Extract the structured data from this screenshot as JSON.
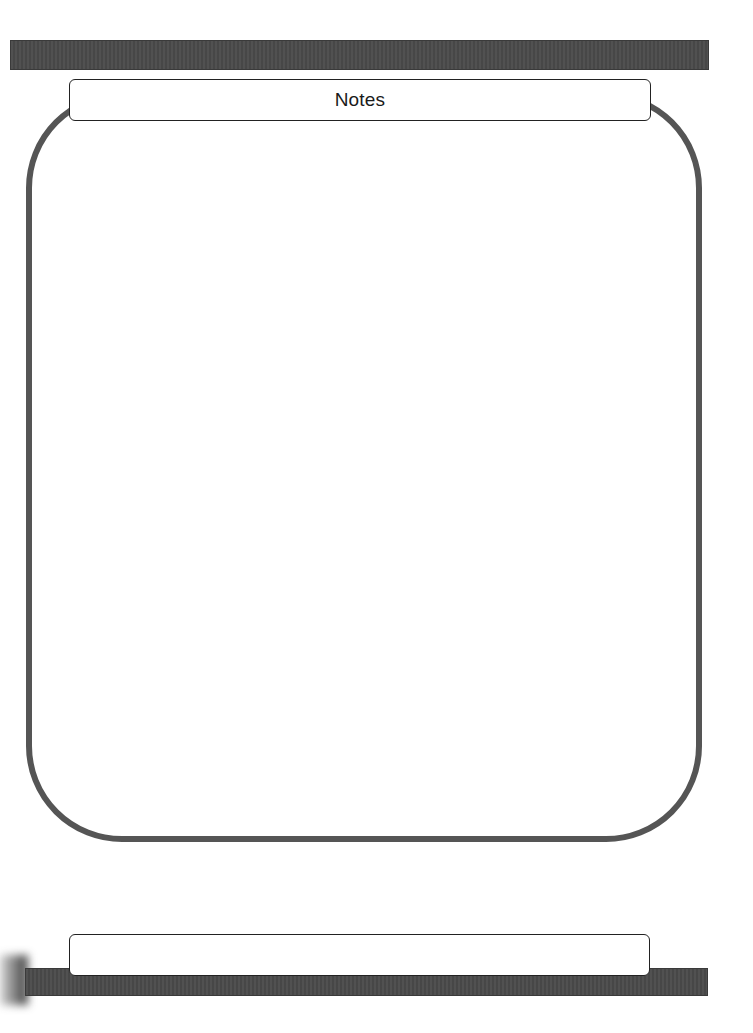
{
  "page": {
    "header": {
      "title": "Notes"
    },
    "notes_area": {
      "content": ""
    },
    "footer": {
      "content": ""
    }
  },
  "colors": {
    "bar": "#4a4a4a",
    "frame_border": "#555555",
    "box_border": "#222222",
    "background": "#ffffff"
  }
}
